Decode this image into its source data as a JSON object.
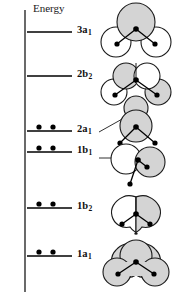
{
  "figure": {
    "title_axis": "Energy",
    "colors": {
      "lobe_shaded": "#d4d4d4",
      "lobe_unshaded": "#ffffff",
      "outline": "#1a1a1a",
      "atom_dot": "#000000",
      "level_line": "#000000",
      "background": "#ffffff"
    }
  },
  "axis": {
    "label": "Energy",
    "label_x": 33,
    "label_y": 3,
    "line_x": 25,
    "line_top": 10,
    "line_bottom": 292,
    "direction": "up"
  },
  "levels": [
    {
      "id": "3a1",
      "label": "3a",
      "sublabel": "1",
      "y": 32,
      "x_start": 27,
      "x_end": 72,
      "electrons": 0,
      "occupancy_dots": [],
      "label_x": 77,
      "label_y": 25,
      "leader_line": null
    },
    {
      "id": "2b2",
      "label": "2b",
      "sublabel": "2",
      "y": 76,
      "x_start": 27,
      "x_end": 72,
      "electrons": 0,
      "occupancy_dots": [],
      "label_x": 77,
      "label_y": 69,
      "leader_line": null
    },
    {
      "id": "2a1",
      "label": "2a",
      "sublabel": "1",
      "y": 131,
      "x_start": 27,
      "x_end": 72,
      "electrons": 2,
      "occupancy_dots": [
        39,
        53
      ],
      "label_x": 77,
      "label_y": 124,
      "leader_line": {
        "x1": 99,
        "y1": 129,
        "x2": 118,
        "y2": 118
      }
    },
    {
      "id": "1b1",
      "label": "1b",
      "sublabel": "1",
      "y": 152,
      "x_start": 27,
      "x_end": 72,
      "electrons": 2,
      "occupancy_dots": [
        39,
        53
      ],
      "label_x": 77,
      "label_y": 145,
      "leader_line": {
        "x1": 99,
        "y1": 156,
        "x2": 122,
        "y2": 156
      }
    },
    {
      "id": "1b2",
      "label": "1b",
      "sublabel": "2",
      "y": 208,
      "x_start": 27,
      "x_end": 72,
      "electrons": 2,
      "occupancy_dots": [
        39,
        53
      ],
      "label_x": 77,
      "label_y": 201,
      "leader_line": null
    },
    {
      "id": "1a1",
      "label": "1a",
      "sublabel": "1",
      "y": 256,
      "x_start": 27,
      "x_end": 72,
      "electrons": 2,
      "occupancy_dots": [
        39,
        53
      ],
      "label_x": 77,
      "label_y": 249,
      "leader_line": null
    }
  ],
  "orbitals": [
    {
      "id": "3a1-orbital",
      "for_level": "3a1",
      "description": "large shaded lobe on oxygen, two unshaded lobes on hydrogens",
      "center_x": 136,
      "center_y": 34
    },
    {
      "id": "2b2-orbital",
      "for_level": "2b2",
      "description": "four lobes, two shaded upper and alternating lower",
      "center_x": 136,
      "center_y": 88
    },
    {
      "id": "2a1-orbital",
      "for_level": "2a1",
      "description": "single shaded lobe centered on oxygen",
      "center_x": 136,
      "center_y": 130
    },
    {
      "id": "1b1-orbital",
      "for_level": "1b1",
      "description": "two lobes, unshaded left and shaded right, pure p lone pair",
      "center_x": 136,
      "center_y": 170
    },
    {
      "id": "1b2-orbital",
      "for_level": "1b2",
      "description": "three-lobed cloud, left half unshaded and right half shaded, vertical node",
      "center_x": 136,
      "center_y": 218
    },
    {
      "id": "1a1-orbital",
      "for_level": "1a1",
      "description": "three-lobed fully shaded bonding cloud",
      "center_x": 136,
      "center_y": 268
    }
  ]
}
